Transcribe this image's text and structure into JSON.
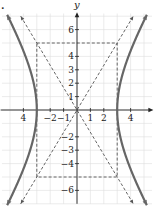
{
  "problem_marker": ".",
  "chart_data": {
    "type": "line",
    "title": "",
    "xlabel": "x",
    "ylabel": "y",
    "xlim": [
      -5.8,
      5.8
    ],
    "ylim": [
      -7,
      8
    ],
    "grid": true,
    "x_ticks": [
      -4,
      -2,
      -1,
      1,
      2,
      4
    ],
    "x_tick_labels": [
      "4",
      "−2",
      "−1",
      "1",
      "2",
      "4"
    ],
    "y_ticks": [
      6,
      4,
      3,
      2,
      1,
      -2,
      -3,
      -4,
      -6
    ],
    "y_tick_labels": [
      "6",
      "4",
      "3",
      "2",
      "1",
      "−2",
      "−3",
      "−4",
      "−6"
    ],
    "curve": {
      "name": "hyperbola",
      "equation": "x^2/9 - y^2/25 = 1",
      "vertices": [
        [
          -3,
          0
        ],
        [
          3,
          0
        ]
      ],
      "color": "#666666",
      "style": "solid-thick"
    },
    "asymptotes": [
      {
        "name": "y = 5/3 x",
        "slope": 1.6667,
        "style": "dashed"
      },
      {
        "name": "y = -5/3 x",
        "slope": -1.6667,
        "style": "dashed"
      }
    ],
    "fundamental_rectangle": {
      "x": [
        -3,
        3
      ],
      "y": [
        -5,
        5
      ],
      "style": "dashed"
    }
  }
}
